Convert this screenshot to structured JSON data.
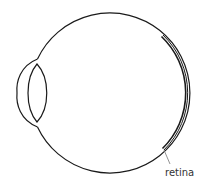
{
  "diagram": {
    "labels": [
      {
        "id": "retina",
        "text": "retina"
      }
    ],
    "colors": {
      "stroke": "#1a1a1a",
      "leader": "#777777",
      "label": "#333333",
      "background": "#ffffff"
    }
  }
}
